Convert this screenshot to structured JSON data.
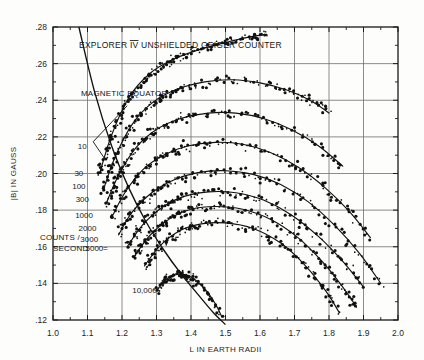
{
  "figure": {
    "title": "EXPLORER IV UNSHIELDED GEIGER COUNTER",
    "title_roman": "IV",
    "title_pre": "EXPLORER",
    "title_post": "UNSHIELDED GEIGER COUNTER",
    "annotation_equator": "MAGNETIC EQUATOR",
    "legend_line1": "COUNTS /",
    "legend_line2": "SECOND",
    "legend_equals": "="
  },
  "chart_data": {
    "type": "scatter",
    "title": "EXPLORER IV UNSHIELDED GEIGER COUNTER",
    "xlabel": "L IN EARTH RADII",
    "ylabel": "|B| IN GAUSS",
    "xlim": [
      1.0,
      2.0
    ],
    "ylim": [
      0.12,
      0.28
    ],
    "xticks": [
      "1.0",
      "1.1",
      "1.2",
      "1.3",
      "1.4",
      "1.5",
      "1.6",
      "1.7",
      "1.8",
      "1.9",
      "2.0"
    ],
    "xtick_values": [
      1.0,
      1.1,
      1.2,
      1.3,
      1.4,
      1.5,
      1.6,
      1.7,
      1.8,
      1.9,
      2.0
    ],
    "yticks": [
      ".28",
      ".26",
      ".24",
      ".22",
      ".20",
      ".18",
      ".16",
      ".14",
      ".12"
    ],
    "ytick_values": [
      0.28,
      0.26,
      0.24,
      0.22,
      0.2,
      0.18,
      0.16,
      0.14,
      0.12
    ],
    "minor_tick_step_x": 0.05,
    "minor_tick_step_y": 0.01,
    "grid": true,
    "legend": "none",
    "contour_label_units": "COUNTS / SECOND",
    "contours": [
      {
        "label": "10",
        "value": 10,
        "label_pos": [
          1.085,
          0.2135
        ],
        "points": [
          [
            1.135,
            0.2
          ],
          [
            1.17,
            0.221
          ],
          [
            1.22,
            0.2415
          ],
          [
            1.28,
            0.2545
          ],
          [
            1.35,
            0.2625
          ],
          [
            1.43,
            0.268
          ],
          [
            1.5,
            0.2715
          ],
          [
            1.56,
            0.2742
          ],
          [
            1.62,
            0.276
          ]
        ]
      },
      {
        "label": "30",
        "value": 30,
        "label_pos": [
          1.075,
          0.1985
        ],
        "points": [
          [
            1.145,
            0.1905
          ],
          [
            1.18,
            0.209
          ],
          [
            1.23,
            0.227
          ],
          [
            1.29,
            0.239
          ],
          [
            1.36,
            0.246
          ],
          [
            1.44,
            0.25
          ],
          [
            1.52,
            0.2512
          ],
          [
            1.6,
            0.2495
          ],
          [
            1.68,
            0.2455
          ],
          [
            1.75,
            0.2395
          ],
          [
            1.8,
            0.233
          ]
        ]
      },
      {
        "label": "100",
        "value": 100,
        "label_pos": [
          1.075,
          0.1918
        ],
        "points": [
          [
            1.155,
            0.184
          ],
          [
            1.19,
            0.199
          ],
          [
            1.24,
            0.214
          ],
          [
            1.3,
            0.224
          ],
          [
            1.37,
            0.23
          ],
          [
            1.45,
            0.233
          ],
          [
            1.53,
            0.233
          ],
          [
            1.61,
            0.23
          ],
          [
            1.69,
            0.224
          ],
          [
            1.77,
            0.215
          ],
          [
            1.84,
            0.204
          ]
        ]
      },
      {
        "label": "300",
        "value": 300,
        "label_pos": [
          1.085,
          0.1845
        ],
        "points": [
          [
            1.17,
            0.176
          ],
          [
            1.21,
            0.19
          ],
          [
            1.26,
            0.202
          ],
          [
            1.32,
            0.21
          ],
          [
            1.39,
            0.215
          ],
          [
            1.47,
            0.217
          ],
          [
            1.55,
            0.216
          ],
          [
            1.63,
            0.2115
          ],
          [
            1.71,
            0.2035
          ],
          [
            1.79,
            0.192
          ],
          [
            1.86,
            0.179
          ],
          [
            1.92,
            0.165
          ]
        ]
      },
      {
        "label": "1000",
        "value": 1000,
        "label_pos": [
          1.09,
          0.1755
        ],
        "points": [
          [
            1.19,
            0.1665
          ],
          [
            1.23,
            0.179
          ],
          [
            1.29,
            0.19
          ],
          [
            1.35,
            0.1965
          ],
          [
            1.42,
            0.2005
          ],
          [
            1.5,
            0.2015
          ],
          [
            1.58,
            0.1995
          ],
          [
            1.66,
            0.194
          ],
          [
            1.74,
            0.1845
          ],
          [
            1.82,
            0.171
          ],
          [
            1.89,
            0.156
          ],
          [
            1.95,
            0.14
          ]
        ]
      },
      {
        "label": "2000",
        "value": 2000,
        "label_pos": [
          1.1,
          0.1688
        ],
        "points": [
          [
            1.215,
            0.16
          ],
          [
            1.26,
            0.172
          ],
          [
            1.32,
            0.182
          ],
          [
            1.38,
            0.1875
          ],
          [
            1.45,
            0.19
          ],
          [
            1.53,
            0.1895
          ],
          [
            1.61,
            0.1855
          ],
          [
            1.69,
            0.1775
          ],
          [
            1.77,
            0.1655
          ],
          [
            1.84,
            0.152
          ],
          [
            1.9,
            0.138
          ]
        ]
      },
      {
        "label": "3000",
        "value": 3000,
        "label_pos": [
          1.105,
          0.1628
        ],
        "points": [
          [
            1.235,
            0.1545
          ],
          [
            1.28,
            0.166
          ],
          [
            1.34,
            0.1755
          ],
          [
            1.4,
            0.1805
          ],
          [
            1.47,
            0.182
          ],
          [
            1.55,
            0.1805
          ],
          [
            1.63,
            0.175
          ],
          [
            1.71,
            0.165
          ],
          [
            1.78,
            0.152
          ],
          [
            1.84,
            0.138
          ],
          [
            1.88,
            0.127
          ]
        ]
      },
      {
        "label": "5000",
        "value": 5000,
        "label_pos": [
          1.12,
          0.1578
        ],
        "points": [
          [
            1.265,
            0.1495
          ],
          [
            1.31,
            0.1605
          ],
          [
            1.37,
            0.169
          ],
          [
            1.43,
            0.1725
          ],
          [
            1.5,
            0.173
          ],
          [
            1.58,
            0.17
          ],
          [
            1.66,
            0.162
          ],
          [
            1.73,
            0.15
          ],
          [
            1.79,
            0.136
          ],
          [
            1.83,
            0.124
          ]
        ]
      },
      {
        "label": "10,000",
        "value": 10000,
        "label_pos": [
          1.265,
          0.135
        ],
        "points": [
          [
            1.3,
            0.136
          ],
          [
            1.33,
            0.1425
          ],
          [
            1.365,
            0.145
          ],
          [
            1.4,
            0.1435
          ],
          [
            1.44,
            0.137
          ],
          [
            1.47,
            0.129
          ],
          [
            1.49,
            0.1215
          ]
        ]
      }
    ],
    "magnetic_equator": {
      "label": "MAGNETIC EQUATOR",
      "points": [
        [
          1.075,
          0.28
        ],
        [
          1.12,
          0.245
        ],
        [
          1.17,
          0.215
        ],
        [
          1.22,
          0.192
        ],
        [
          1.27,
          0.1735
        ],
        [
          1.32,
          0.1585
        ],
        [
          1.37,
          0.1455
        ],
        [
          1.42,
          0.134
        ],
        [
          1.465,
          0.124
        ],
        [
          1.5,
          0.1175
        ]
      ],
      "leader_from": [
        1.215,
        0.237
      ],
      "leader_to": [
        1.152,
        0.2075
      ]
    },
    "scatter_note": "Dense measured points follow each contour; heaviest clustering near L = 1.25-1.40 and along descending branches."
  },
  "axes": {
    "x_label": "L IN EARTH RADII",
    "y_label": "|B| IN GAUSS"
  }
}
